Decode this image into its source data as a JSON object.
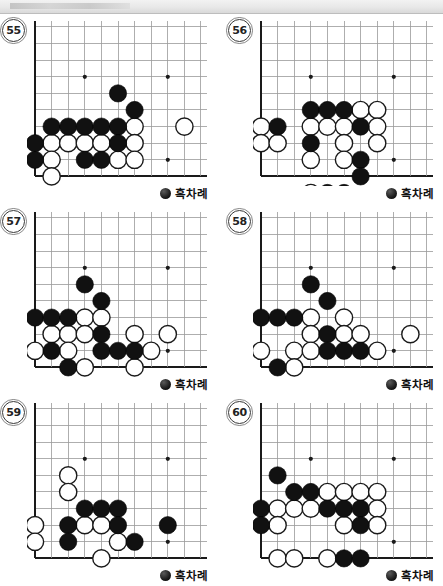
{
  "page": {
    "topbar_present": true
  },
  "board_geometry": {
    "cell": 16.6,
    "cols": 11,
    "rows": 10,
    "origin_x": 8,
    "origin_y": 8,
    "star_points": [
      [
        3,
        3
      ],
      [
        8,
        3
      ]
    ],
    "star_point_bottom": [
      8,
      8
    ],
    "note": "Corner view: column 0 is the left board edge, row 9 is the bottom board edge",
    "edge_color": "#1a1a1a",
    "line_color": "#9a9a9a",
    "black_color": "#111111",
    "white_color": "#ffffff"
  },
  "turn_label": {
    "text": "흑차례",
    "marker": "black-stone-icon"
  },
  "problems": [
    {
      "number": "55",
      "black": [
        [
          5,
          4
        ],
        [
          6,
          5
        ],
        [
          1,
          6
        ],
        [
          2,
          6
        ],
        [
          3,
          6
        ],
        [
          4,
          6
        ],
        [
          5,
          6
        ],
        [
          0,
          7
        ],
        [
          5,
          7
        ],
        [
          0,
          8
        ],
        [
          3,
          8
        ],
        [
          4,
          8
        ]
      ],
      "white": [
        [
          6,
          6
        ],
        [
          9,
          6
        ],
        [
          1,
          7
        ],
        [
          2,
          7
        ],
        [
          3,
          7
        ],
        [
          4,
          7
        ],
        [
          6,
          7
        ],
        [
          1,
          8
        ],
        [
          5,
          8
        ],
        [
          6,
          8
        ],
        [
          1,
          9
        ]
      ]
    },
    {
      "number": "56",
      "black": [
        [
          3,
          5
        ],
        [
          4,
          5
        ],
        [
          5,
          5
        ],
        [
          1,
          6
        ],
        [
          6,
          6
        ],
        [
          3,
          7
        ],
        [
          6,
          8
        ],
        [
          6,
          9
        ],
        [
          4,
          10
        ],
        [
          5,
          10
        ]
      ],
      "white": [
        [
          6,
          5
        ],
        [
          7,
          5
        ],
        [
          0,
          6
        ],
        [
          3,
          6
        ],
        [
          4,
          6
        ],
        [
          5,
          6
        ],
        [
          7,
          6
        ],
        [
          0,
          7
        ],
        [
          1,
          7
        ],
        [
          5,
          7
        ],
        [
          7,
          7
        ],
        [
          3,
          8
        ],
        [
          5,
          8
        ],
        [
          3,
          10
        ]
      ]
    },
    {
      "number": "57",
      "black": [
        [
          3,
          4
        ],
        [
          4,
          5
        ],
        [
          0,
          6
        ],
        [
          1,
          6
        ],
        [
          2,
          6
        ],
        [
          4,
          7
        ],
        [
          1,
          8
        ],
        [
          4,
          8
        ],
        [
          5,
          8
        ],
        [
          6,
          8
        ],
        [
          2,
          9
        ]
      ],
      "white": [
        [
          3,
          6
        ],
        [
          4,
          6
        ],
        [
          1,
          7
        ],
        [
          2,
          7
        ],
        [
          3,
          7
        ],
        [
          6,
          7
        ],
        [
          8,
          7
        ],
        [
          0,
          8
        ],
        [
          2,
          8
        ],
        [
          7,
          8
        ],
        [
          3,
          9
        ],
        [
          6,
          9
        ]
      ]
    },
    {
      "number": "58",
      "black": [
        [
          3,
          4
        ],
        [
          4,
          5
        ],
        [
          0,
          6
        ],
        [
          1,
          6
        ],
        [
          2,
          6
        ],
        [
          4,
          7
        ],
        [
          4,
          8
        ],
        [
          5,
          8
        ],
        [
          6,
          8
        ],
        [
          1,
          9
        ]
      ],
      "white": [
        [
          3,
          6
        ],
        [
          5,
          6
        ],
        [
          3,
          7
        ],
        [
          5,
          7
        ],
        [
          6,
          7
        ],
        [
          9,
          7
        ],
        [
          0,
          8
        ],
        [
          2,
          8
        ],
        [
          3,
          8
        ],
        [
          7,
          8
        ],
        [
          2,
          9
        ]
      ]
    },
    {
      "number": "59",
      "black": [
        [
          3,
          6
        ],
        [
          4,
          6
        ],
        [
          5,
          6
        ],
        [
          2,
          7
        ],
        [
          5,
          7
        ],
        [
          8,
          7
        ],
        [
          2,
          8
        ],
        [
          6,
          8
        ]
      ],
      "white": [
        [
          2,
          4
        ],
        [
          2,
          5
        ],
        [
          0,
          7
        ],
        [
          3,
          7
        ],
        [
          4,
          7
        ],
        [
          0,
          8
        ],
        [
          5,
          8
        ],
        [
          4,
          9
        ]
      ]
    },
    {
      "number": "60",
      "black": [
        [
          1,
          4
        ],
        [
          2,
          5
        ],
        [
          3,
          5
        ],
        [
          0,
          6
        ],
        [
          4,
          6
        ],
        [
          5,
          6
        ],
        [
          6,
          6
        ],
        [
          0,
          7
        ],
        [
          6,
          7
        ],
        [
          5,
          9
        ],
        [
          6,
          9
        ]
      ],
      "white": [
        [
          4,
          5
        ],
        [
          5,
          5
        ],
        [
          6,
          5
        ],
        [
          7,
          5
        ],
        [
          1,
          6
        ],
        [
          2,
          6
        ],
        [
          3,
          6
        ],
        [
          7,
          6
        ],
        [
          1,
          7
        ],
        [
          5,
          7
        ],
        [
          7,
          7
        ],
        [
          1,
          9
        ],
        [
          2,
          9
        ],
        [
          4,
          9
        ]
      ]
    }
  ]
}
